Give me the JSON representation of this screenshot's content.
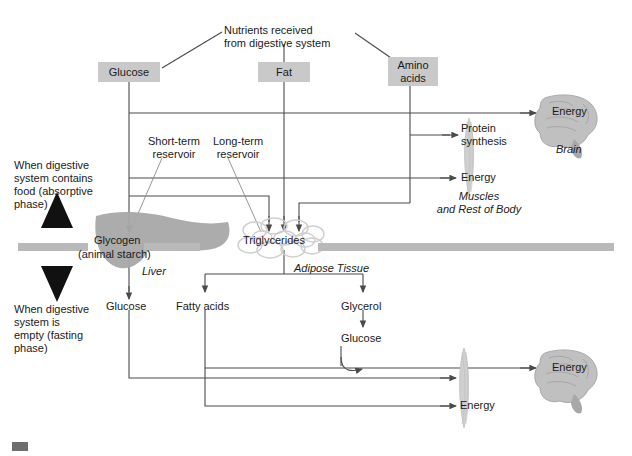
{
  "diagram": {
    "title_note": "Nutrients received\nfrom digestive system",
    "nutrient_boxes": [
      {
        "label": "Glucose",
        "x": 98,
        "y": 62,
        "w": 62,
        "h": 20
      },
      {
        "label": "Fat",
        "x": 258,
        "y": 62,
        "w": 52,
        "h": 20
      },
      {
        "label": "Amino\nacids",
        "x": 388,
        "y": 57,
        "w": 50,
        "h": 29
      }
    ],
    "source_label": {
      "text": "Nutrients received\nfrom digestive system",
      "x": 224,
      "y": 24
    },
    "phase_labels": {
      "absorptive": "When digestive\nsystem contains\nfood (absorptive\nphase)",
      "fasting": "When digestive\nsystem is\nempty (fasting\nphase)"
    },
    "reservoir_labels": [
      {
        "text": "Short-term\nreservoir",
        "x": 152,
        "y": 140
      },
      {
        "text": "Long-term\nreservoir",
        "x": 219,
        "y": 140
      }
    ],
    "organs": [
      {
        "name": "Liver",
        "store": "Glycogen",
        "store_sub": "(animal starch)"
      },
      {
        "name": "Adipose Tissue",
        "store": "Triglycerides"
      },
      {
        "name": "Brain",
        "value": "Energy"
      },
      {
        "name": "Muscles\nand Rest of Body",
        "value": "Energy"
      }
    ],
    "store_labels": {
      "glycogen": "Glycogen",
      "glycogen_sub": "(animal starch)",
      "triglycerides": "Triglycerides",
      "liver": "Liver",
      "adipose": "Adipose Tissue"
    },
    "outputs_top": {
      "protein_synthesis": "Protein\nsynthesis",
      "energy_muscles": "Energy",
      "energy_brain": "Energy",
      "brain": "Brain",
      "muscles": "Muscles\nand Rest of Body"
    },
    "breakdown": {
      "glucose_from_glycogen": "Glucose",
      "fatty_acids": "Fatty acids",
      "glycerol": "Glycerol",
      "glucose_from_glycerol": "Glucose"
    },
    "outputs_bottom": {
      "energy_brain": "Energy",
      "brain": "Brain",
      "energy_muscles": "Energy"
    },
    "colors": {
      "box_fill": "#c9c9c9",
      "divider_bar": "#b9b9b9",
      "organ_gray": "#a8a8a8",
      "line": "#4a4a4a",
      "text": "#1a1a1a",
      "corner_mark": "#6e6e6e"
    }
  }
}
